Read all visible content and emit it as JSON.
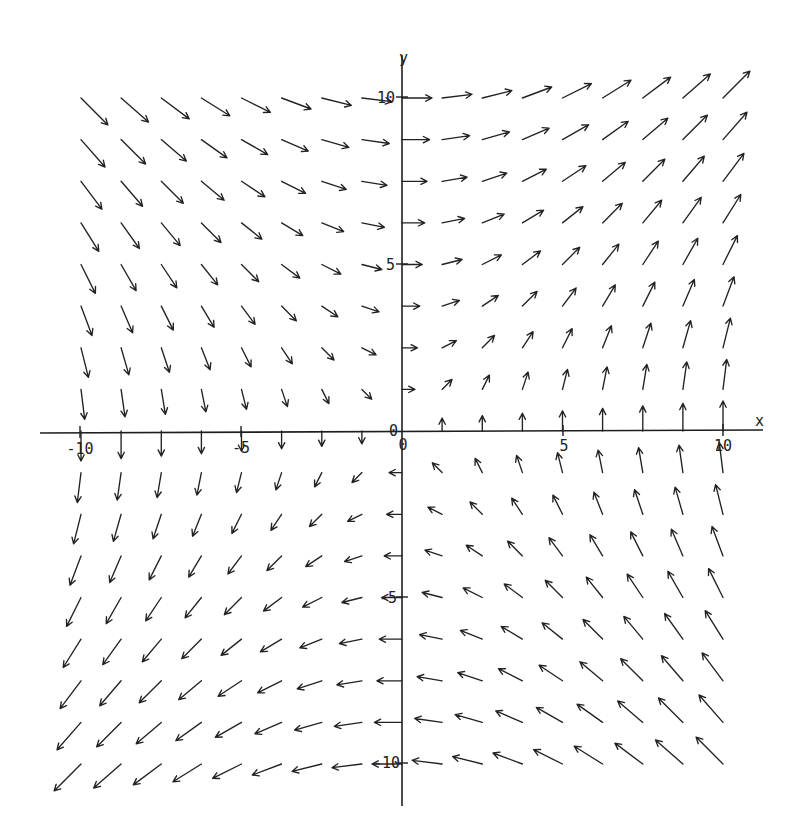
{
  "chart_data": {
    "type": "quiver",
    "title": "",
    "xlabel": "x",
    "ylabel": "y",
    "field": {
      "u": "y",
      "v": "x"
    },
    "x_grid": [
      -10,
      -8.75,
      -7.5,
      -6.25,
      -5,
      -3.75,
      -2.5,
      -1.25,
      0,
      1.25,
      2.5,
      3.75,
      5,
      6.25,
      7.5,
      8.75,
      10
    ],
    "y_grid": [
      10,
      8.75,
      7.5,
      6.25,
      5,
      3.75,
      2.5,
      1.25,
      0,
      -1.25,
      -2.5,
      -3.75,
      -5,
      -6.25,
      -7.5,
      -8.75,
      -10
    ],
    "xlim": [
      -11.3,
      11.3
    ],
    "ylim": [
      -11.3,
      11.3
    ],
    "x_ticks": [
      -10,
      -5,
      0,
      5,
      10
    ],
    "x_tick_labels": [
      "-10",
      "-5",
      "0",
      "5",
      "10"
    ],
    "y_ticks": [
      10,
      5,
      0,
      -5,
      -10
    ],
    "y_tick_labels": [
      "10",
      "5",
      "0",
      "-5",
      "-10"
    ],
    "grid": false,
    "legend": null,
    "colors": {
      "ink": "#222222",
      "background": "#ffffff"
    }
  }
}
